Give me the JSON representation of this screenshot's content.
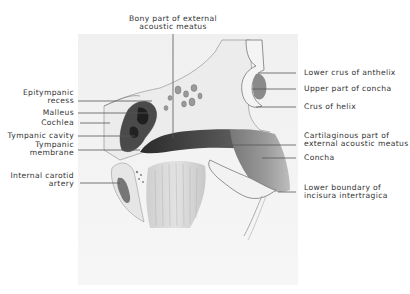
{
  "figure": {
    "top_label": {
      "line1": "Bony part of external",
      "line2": "acoustic meatus"
    },
    "left_labels": [
      {
        "line1": "Epitympanic",
        "line2": "recess"
      },
      {
        "line1": "Malleus"
      },
      {
        "line1": "Cochlea"
      },
      {
        "line1": "Tympanic cavity"
      },
      {
        "line1": "Tympanic",
        "line2": "membrane"
      },
      {
        "line1": "Internal carotid",
        "line2": "artery"
      }
    ],
    "right_labels": [
      {
        "line1": "Lower crus of anthelix"
      },
      {
        "line1": "Upper part of concha"
      },
      {
        "line1": "Crus of helix"
      },
      {
        "line1": "Cartilaginous part of",
        "line2": "external acoustic meatus"
      },
      {
        "line1": "Concha"
      },
      {
        "line1": "Lower boundary of",
        "line2": "incisura intertragica"
      }
    ]
  }
}
